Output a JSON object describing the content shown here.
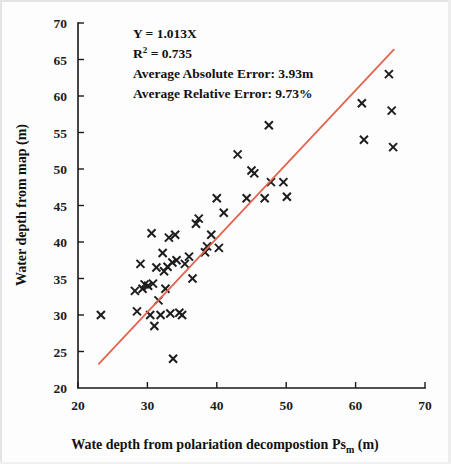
{
  "chart_data": {
    "type": "scatter",
    "title": "",
    "xlabel": "Wate depth from polariation decompostion Ps",
    "xlabel_sub": "m",
    "xlabel_unit": "(m)",
    "ylabel": "Water  depth from map (m)",
    "xlim": [
      20,
      70
    ],
    "ylim": [
      20,
      70
    ],
    "xticks": [
      20,
      30,
      40,
      50,
      60,
      70
    ],
    "yticks": [
      20,
      25,
      30,
      35,
      40,
      45,
      50,
      55,
      60,
      65,
      70
    ],
    "grid": false,
    "legend": "none",
    "marker_symbol": "x",
    "marker_color": "#1d1d1d",
    "line_color": "#e4644e",
    "fit_line": {
      "equation": "Y = 1.013X",
      "slope": 1.013,
      "intercept": 0,
      "x_start": 23.0,
      "x_end": 65.5
    },
    "annotations": {
      "equation": "Y = 1.013X",
      "r_squared_label": "R",
      "r_squared_sup": "2",
      "r_squared_value": " = 0.735",
      "avg_absolute_error": "Average Absolute Error: 3.93m",
      "avg_relative_error": "Average Relative Error: 9.73%"
    },
    "points": [
      {
        "x": 23.3,
        "y": 30.0
      },
      {
        "x": 28.2,
        "y": 33.3
      },
      {
        "x": 28.5,
        "y": 30.5
      },
      {
        "x": 29.0,
        "y": 37.0
      },
      {
        "x": 29.3,
        "y": 33.6
      },
      {
        "x": 29.6,
        "y": 34.2
      },
      {
        "x": 30.1,
        "y": 34.0
      },
      {
        "x": 30.4,
        "y": 30.0
      },
      {
        "x": 30.6,
        "y": 41.2
      },
      {
        "x": 30.8,
        "y": 34.3
      },
      {
        "x": 31.0,
        "y": 28.5
      },
      {
        "x": 31.3,
        "y": 36.5
      },
      {
        "x": 31.6,
        "y": 32.0
      },
      {
        "x": 31.9,
        "y": 30.0
      },
      {
        "x": 32.2,
        "y": 38.5
      },
      {
        "x": 32.4,
        "y": 36.0
      },
      {
        "x": 32.6,
        "y": 33.6
      },
      {
        "x": 32.9,
        "y": 36.6
      },
      {
        "x": 33.1,
        "y": 40.6
      },
      {
        "x": 33.3,
        "y": 30.2
      },
      {
        "x": 33.6,
        "y": 37.2
      },
      {
        "x": 33.7,
        "y": 24.0
      },
      {
        "x": 34.0,
        "y": 41.0
      },
      {
        "x": 34.2,
        "y": 37.5
      },
      {
        "x": 34.6,
        "y": 30.3
      },
      {
        "x": 35.0,
        "y": 30.0
      },
      {
        "x": 35.4,
        "y": 37.0
      },
      {
        "x": 36.0,
        "y": 38.0
      },
      {
        "x": 36.5,
        "y": 35.0
      },
      {
        "x": 37.0,
        "y": 42.5
      },
      {
        "x": 37.4,
        "y": 43.2
      },
      {
        "x": 38.3,
        "y": 38.6
      },
      {
        "x": 38.6,
        "y": 39.4
      },
      {
        "x": 39.2,
        "y": 41.0
      },
      {
        "x": 40.0,
        "y": 46.0
      },
      {
        "x": 40.3,
        "y": 39.2
      },
      {
        "x": 41.0,
        "y": 44.0
      },
      {
        "x": 43.0,
        "y": 52.0
      },
      {
        "x": 44.3,
        "y": 46.0
      },
      {
        "x": 45.0,
        "y": 49.8
      },
      {
        "x": 45.4,
        "y": 49.4
      },
      {
        "x": 46.9,
        "y": 46.0
      },
      {
        "x": 47.5,
        "y": 56.0
      },
      {
        "x": 47.8,
        "y": 48.2
      },
      {
        "x": 49.6,
        "y": 48.2
      },
      {
        "x": 50.1,
        "y": 46.2
      },
      {
        "x": 60.9,
        "y": 59.0
      },
      {
        "x": 61.2,
        "y": 54.0
      },
      {
        "x": 64.8,
        "y": 63.0
      },
      {
        "x": 65.2,
        "y": 58.0
      },
      {
        "x": 65.4,
        "y": 53.0
      }
    ]
  }
}
